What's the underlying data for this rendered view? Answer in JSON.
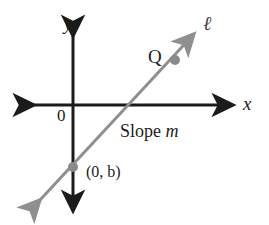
{
  "figure": {
    "type": "coordinate-plane-line-graph",
    "background_color": "#ffffff",
    "axis_color": "#1b1b1b",
    "line_color": "#8a8a8a",
    "point_color": "#8a8a8a",
    "text_color": "#1b1b1b",
    "labels": {
      "y_axis": "y",
      "x_axis": "x",
      "origin": "0",
      "line_name": "ℓ",
      "point_q": "Q",
      "y_intercept": "(0, b)",
      "slope_text": "Slope ",
      "slope_variable": "m"
    },
    "geometry": {
      "x_axis": {
        "x1": 30,
        "y1": 105,
        "x2": 237,
        "y2": 105
      },
      "y_axis": {
        "x1": 73,
        "y1": 32,
        "x2": 73,
        "y2": 215
      },
      "line": {
        "x1": 36,
        "y1": 205,
        "x2": 198,
        "y2": 30
      },
      "points": [
        {
          "name": "y-intercept",
          "x": 73,
          "y": 167,
          "r": 5
        },
        {
          "name": "Q",
          "x": 175,
          "y": 60,
          "r": 5
        }
      ]
    }
  }
}
